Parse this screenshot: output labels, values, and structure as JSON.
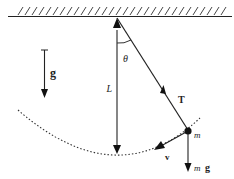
{
  "diagram": {
    "labels": {
      "gravity": "g",
      "angle": "θ",
      "length": "L",
      "tension": "T",
      "mass": "m",
      "velocity": "v",
      "weight_m": "m",
      "weight_g": "g"
    },
    "colors": {
      "line": "#222222",
      "background": "#ffffff"
    }
  }
}
